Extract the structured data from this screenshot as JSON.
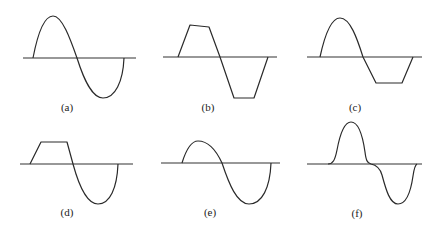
{
  "figure": {
    "panels": [
      {
        "label": "(a)",
        "shape": "full sine wave"
      },
      {
        "label": "(b)",
        "shape": "trapezoidal wave with sloped positive top and flat negative bottom"
      },
      {
        "label": "(c)",
        "shape": "sine positive half, clipped flat negative half"
      },
      {
        "label": "(d)",
        "shape": "clipped flat positive half, sine negative half"
      },
      {
        "label": "(e)",
        "shape": "reduced positive half-sine, full negative half-sine"
      },
      {
        "label": "(f)",
        "shape": "crossover-distorted sine wave"
      }
    ]
  },
  "colors": {
    "line": "#2a2a2a",
    "background": "#ffffff"
  }
}
